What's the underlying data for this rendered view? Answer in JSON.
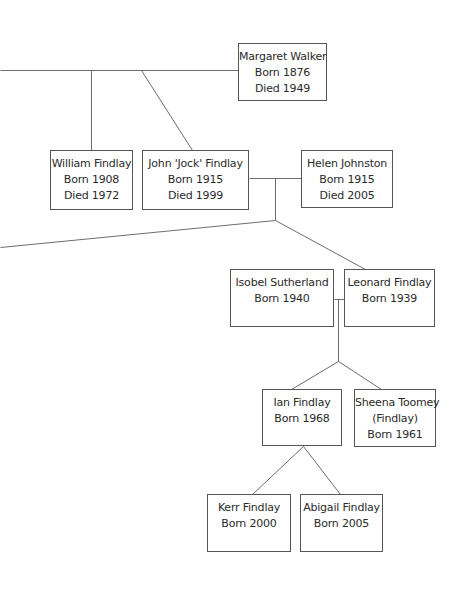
{
  "diagram": {
    "type": "family-tree",
    "people": [
      {
        "id": "margaret",
        "name": "Margaret Walker",
        "lines": [
          "Born 1876",
          "Died 1949"
        ],
        "box": [
          238,
          43,
          89,
          58
        ]
      },
      {
        "id": "william",
        "name": "William Findlay",
        "lines": [
          "Born 1908",
          "Died 1972"
        ],
        "box": [
          50,
          150,
          83,
          60
        ]
      },
      {
        "id": "john",
        "name": "John 'Jock' Findlay",
        "lines": [
          "Born 1915",
          "Died 1999"
        ],
        "box": [
          142,
          150,
          107,
          60
        ]
      },
      {
        "id": "helen",
        "name": "Helen Johnston",
        "lines": [
          "Born 1915",
          "Died 2005"
        ],
        "box": [
          301,
          150,
          92,
          58
        ]
      },
      {
        "id": "isobel",
        "name": "Isobel Sutherland",
        "lines": [
          "Born 1940"
        ],
        "box": [
          230,
          269,
          104,
          58
        ]
      },
      {
        "id": "leonard",
        "name": "Leonard Findlay",
        "lines": [
          "Born 1939"
        ],
        "box": [
          344,
          269,
          91,
          58
        ]
      },
      {
        "id": "ian",
        "name": "Ian Findlay",
        "lines": [
          "Born 1968"
        ],
        "box": [
          262,
          389,
          80,
          57
        ]
      },
      {
        "id": "sheena",
        "name": "Sheena Toomey",
        "lines": [
          "(Findlay)",
          "Born 1961"
        ],
        "box": [
          354,
          389,
          82,
          58
        ]
      },
      {
        "id": "kerr",
        "name": "Kerr Findlay",
        "lines": [
          "Born 2000"
        ],
        "box": [
          207,
          494,
          84,
          58
        ]
      },
      {
        "id": "abigail",
        "name": "Abigail Findlay",
        "lines": [
          "Born 2005"
        ],
        "box": [
          300,
          494,
          83,
          58
        ]
      }
    ],
    "connectors": [
      {
        "from": [
          0,
          70
        ],
        "to": [
          238,
          70
        ]
      },
      {
        "from": [
          91,
          70
        ],
        "to": [
          91,
          150
        ]
      },
      {
        "from": [
          141,
          70
        ],
        "to": [
          192,
          150
        ]
      },
      {
        "from": [
          249,
          178
        ],
        "to": [
          301,
          178
        ]
      },
      {
        "from": [
          275,
          178
        ],
        "to": [
          275,
          220
        ]
      },
      {
        "from": [
          275,
          220
        ],
        "to": [
          0,
          247
        ]
      },
      {
        "from": [
          275,
          220
        ],
        "to": [
          365,
          269
        ]
      },
      {
        "from": [
          334,
          299
        ],
        "to": [
          344,
          299
        ]
      },
      {
        "from": [
          338,
          299
        ],
        "to": [
          338,
          361
        ]
      },
      {
        "from": [
          338,
          361
        ],
        "to": [
          291,
          389
        ]
      },
      {
        "from": [
          338,
          361
        ],
        "to": [
          381,
          389
        ]
      },
      {
        "from": [
          303,
          446
        ],
        "to": [
          252,
          494
        ]
      },
      {
        "from": [
          303,
          446
        ],
        "to": [
          340,
          494
        ]
      }
    ],
    "colors": {
      "line": "#6d6d6d",
      "border": "#555555",
      "text": "#2a2a2a",
      "background": "#ffffff"
    }
  }
}
